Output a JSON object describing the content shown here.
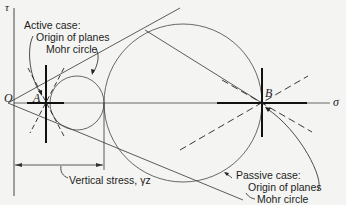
{
  "diagram": {
    "type": "Mohr circle diagram (Rankine earth pressure)",
    "axes": {
      "vertical_label": "τ",
      "horizontal_label": "σ",
      "origin_label": "O"
    },
    "points": {
      "active_point": "A",
      "passive_point": "B"
    },
    "annotations": {
      "active_case": "Active case:",
      "active_origin": "Origin of planes",
      "active_mohr": "Mohr circle",
      "vertical_stress": "Vertical stress, γz",
      "passive_case": "Passive case:",
      "passive_origin": "Origin of planes",
      "passive_mohr": "Mohr circle"
    },
    "colors": {
      "line": "#1a1a1a",
      "thin_line": "#3a3a3a",
      "background": "#f4f4f2"
    }
  }
}
